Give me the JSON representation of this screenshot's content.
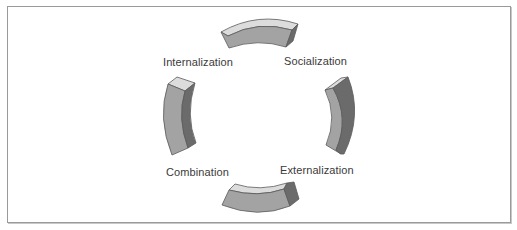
{
  "diagram": {
    "type": "cycle",
    "stages": [
      {
        "id": "socialization",
        "label": "Socialization"
      },
      {
        "id": "externalization",
        "label": "Externalization"
      },
      {
        "id": "combination",
        "label": "Combination"
      },
      {
        "id": "internalization",
        "label": "Internalization"
      }
    ]
  },
  "colors": {
    "front_face": "#a3a3a3",
    "light_face": "#dcdcdc",
    "dark_face": "#6b6b6b",
    "outline": "#5a5a5a",
    "frame_border": "#9a9a9a",
    "text": "#3a3a3a"
  }
}
